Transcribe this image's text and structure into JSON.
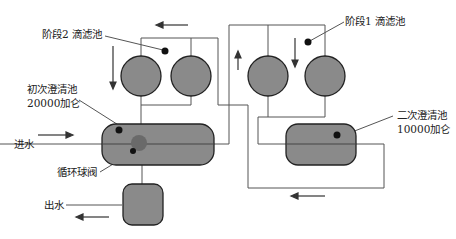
{
  "labels": {
    "stage2_filter": "阶段2  滴滤池",
    "stage1_filter": "阶段1  滴滤池",
    "primary_clarifier_line1": "初次澄清池",
    "primary_clarifier_line2": "20000加仑",
    "secondary_clarifier_line1": "二次澄清池",
    "secondary_clarifier_line2": "10000加仑",
    "inflow": "进水",
    "outflow": "出水",
    "recirculation_valve": "循环球阀"
  },
  "colors": {
    "tank_fill": "#8a8a8a",
    "line": "#555555",
    "outline": "#222222"
  }
}
